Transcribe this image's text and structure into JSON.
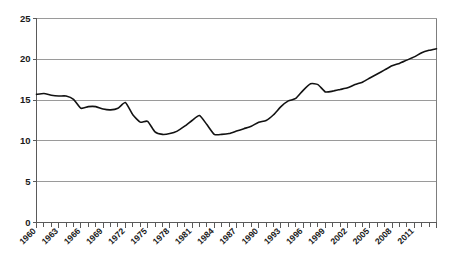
{
  "chart_data": {
    "type": "line",
    "title": "",
    "subtitle": "",
    "xlabel": "",
    "ylabel": "",
    "grid": true,
    "legend": false,
    "legend_position": "none",
    "line_color": "#121212",
    "gridline_color": "#9a9a9a",
    "axis_color": "#5a5a5a",
    "background_color": "#ffffff",
    "xlim": [
      1960,
      2014
    ],
    "ylim": [
      0,
      25
    ],
    "y_ticks": [
      0,
      5,
      10,
      15,
      20,
      25
    ],
    "y_tick_labels": [
      "0",
      "5",
      "10",
      "15",
      "20",
      "25"
    ],
    "x_tick_step": 1,
    "x_label_step": 3,
    "x_tick_labels": [
      "1960",
      "1963",
      "1966",
      "1969",
      "1972",
      "1975",
      "1978",
      "1981",
      "1984",
      "1987",
      "1990",
      "1993",
      "1996",
      "1999",
      "2002",
      "2005",
      "2008",
      "2011"
    ],
    "x": [
      1960,
      1961,
      1962,
      1963,
      1964,
      1965,
      1966,
      1967,
      1968,
      1969,
      1970,
      1971,
      1972,
      1973,
      1974,
      1975,
      1976,
      1977,
      1978,
      1979,
      1980,
      1981,
      1982,
      1983,
      1984,
      1985,
      1986,
      1987,
      1988,
      1989,
      1990,
      1991,
      1992,
      1993,
      1994,
      1995,
      1996,
      1997,
      1998,
      1999,
      2000,
      2001,
      2002,
      2003,
      2004,
      2005,
      2006,
      2007,
      2008,
      2009,
      2010,
      2011,
      2012,
      2013,
      2014
    ],
    "values": [
      15.7,
      15.8,
      15.6,
      15.5,
      15.5,
      15.1,
      14.0,
      14.2,
      14.2,
      13.9,
      13.8,
      14.0,
      14.7,
      13.2,
      12.3,
      12.4,
      11.1,
      10.8,
      10.9,
      11.2,
      11.8,
      12.5,
      13.1,
      12.0,
      10.8,
      10.8,
      10.9,
      11.2,
      11.5,
      11.8,
      12.3,
      12.5,
      13.2,
      14.2,
      14.9,
      15.2,
      16.2,
      17.0,
      16.9,
      16.0,
      16.1,
      16.3,
      16.5,
      16.9,
      17.2,
      17.7,
      18.2,
      18.7,
      19.2,
      19.5,
      19.9,
      20.3,
      20.8,
      21.1,
      21.3
    ],
    "series": [
      {
        "name": "series-1",
        "values": [
          15.7,
          15.8,
          15.6,
          15.5,
          15.5,
          15.1,
          14.0,
          14.2,
          14.2,
          13.9,
          13.8,
          14.0,
          14.7,
          13.2,
          12.3,
          12.4,
          11.1,
          10.8,
          10.9,
          11.2,
          11.8,
          12.5,
          13.1,
          12.0,
          10.8,
          10.8,
          10.9,
          11.2,
          11.5,
          11.8,
          12.3,
          12.5,
          13.2,
          14.2,
          14.9,
          15.2,
          16.2,
          17.0,
          16.9,
          16.0,
          16.1,
          16.3,
          16.5,
          16.9,
          17.2,
          17.7,
          18.2,
          18.7,
          19.2,
          19.5,
          19.9,
          20.3,
          20.8,
          21.1,
          21.3
        ]
      }
    ],
    "annotations": []
  }
}
